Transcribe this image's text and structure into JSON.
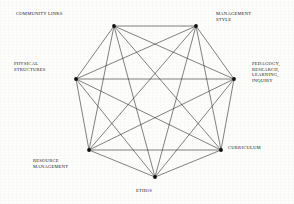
{
  "diagram": {
    "type": "complete-graph",
    "shape": "heptagon",
    "node_count": 7,
    "edge_count": 21,
    "stroke_color": "#1a1a1a",
    "node_color": "#111111",
    "background_color": "#fdfdfc",
    "nodes": [
      {
        "id": "community-links",
        "label": "COMMUNITY LINKS",
        "x": 114,
        "y": 26
      },
      {
        "id": "management-style",
        "label": "MANAGEMENT\nSTYLE",
        "x": 196,
        "y": 26
      },
      {
        "id": "pedagogy-research",
        "label": "PEDAGOGY,\nRESEARCH,\nLEARNING,\nINQUIRY",
        "x": 234,
        "y": 79
      },
      {
        "id": "curriculum",
        "label": "CURRICULUM",
        "x": 221,
        "y": 150
      },
      {
        "id": "ethos",
        "label": "ETHOS",
        "x": 155,
        "y": 177
      },
      {
        "id": "resource-management",
        "label": "RESOURCE\nMANAGEMENT",
        "x": 89,
        "y": 150
      },
      {
        "id": "physical-structures",
        "label": "PHYSICAL\nSTRUCTURES",
        "x": 76,
        "y": 79
      }
    ]
  }
}
